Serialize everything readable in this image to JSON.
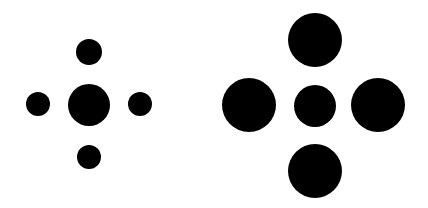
{
  "figure": {
    "color": "#000000",
    "background": "#ffffff",
    "groups": [
      {
        "name": "small-surround",
        "circles": [
          {
            "role": "center",
            "cx": 89,
            "cy": 105,
            "r": 21
          },
          {
            "role": "top",
            "cx": 89,
            "cy": 52,
            "r": 13
          },
          {
            "role": "bottom",
            "cx": 89,
            "cy": 157,
            "r": 12
          },
          {
            "role": "left",
            "cx": 38,
            "cy": 104,
            "r": 12
          },
          {
            "role": "right",
            "cx": 140,
            "cy": 104,
            "r": 12
          }
        ]
      },
      {
        "name": "large-surround",
        "circles": [
          {
            "role": "center",
            "cx": 315,
            "cy": 106,
            "r": 21
          },
          {
            "role": "top",
            "cx": 315,
            "cy": 40,
            "r": 27
          },
          {
            "role": "bottom",
            "cx": 315,
            "cy": 171,
            "r": 27
          },
          {
            "role": "left",
            "cx": 249,
            "cy": 105,
            "r": 27
          },
          {
            "role": "right",
            "cx": 378,
            "cy": 105,
            "r": 27
          }
        ]
      }
    ]
  }
}
